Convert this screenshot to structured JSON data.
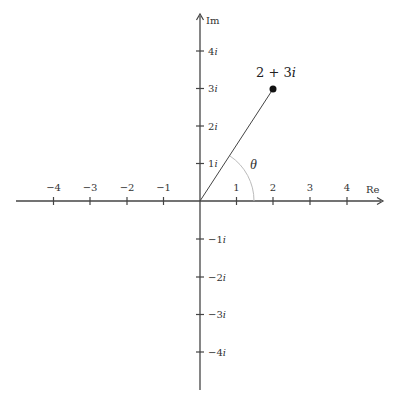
{
  "diagram": {
    "type": "complex-plane",
    "axes": {
      "x_label": "Re",
      "y_label": "Im",
      "x_ticks": [
        {
          "value": -4,
          "label": "−4"
        },
        {
          "value": -3,
          "label": "−3"
        },
        {
          "value": -2,
          "label": "−2"
        },
        {
          "value": -1,
          "label": "−1"
        },
        {
          "value": 1,
          "label": "1"
        },
        {
          "value": 2,
          "label": "2"
        },
        {
          "value": 3,
          "label": "3"
        },
        {
          "value": 4,
          "label": "4"
        }
      ],
      "y_ticks": [
        {
          "value": 4,
          "num": "4",
          "unit": "i"
        },
        {
          "value": 3,
          "num": "3",
          "unit": "i"
        },
        {
          "value": 2,
          "num": "2",
          "unit": "i"
        },
        {
          "value": 1,
          "num": "1",
          "unit": "i"
        },
        {
          "value": -1,
          "num": "−1",
          "unit": "i"
        },
        {
          "value": -2,
          "num": "−2",
          "unit": "i"
        },
        {
          "value": -3,
          "num": "−3",
          "unit": "i"
        },
        {
          "value": -4,
          "num": "−4",
          "unit": "i"
        }
      ],
      "x_range": [
        -5,
        5
      ],
      "y_range": [
        -5,
        5
      ]
    },
    "point": {
      "re": 2,
      "im": 3,
      "label_main": "2 + 3",
      "label_unit": "i"
    },
    "angle": {
      "label": "θ"
    },
    "colors": {
      "axis": "#444444",
      "vector": "#444444",
      "arc": "#bbbbbb",
      "point": "#111111"
    }
  }
}
